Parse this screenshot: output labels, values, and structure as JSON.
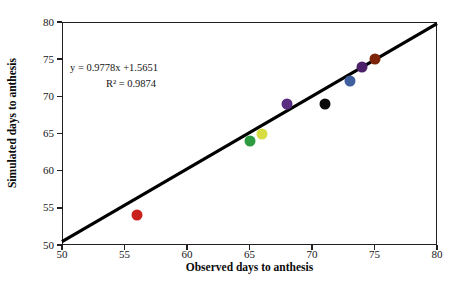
{
  "chart_data": {
    "type": "scatter",
    "title": "",
    "xlabel": "Observed days to anthesis",
    "ylabel": "Simulated days to anthesis",
    "xlim": [
      50,
      80
    ],
    "ylim": [
      50,
      80
    ],
    "xticks": [
      50,
      55,
      60,
      65,
      70,
      75,
      80
    ],
    "yticks": [
      50,
      55,
      60,
      65,
      70,
      75,
      80
    ],
    "grid": false,
    "legend": "none",
    "annotations": {
      "equation": "y = 0.9778x +1.5651",
      "r_squared": "R² = 0.9874",
      "slope": 0.9778,
      "intercept": 1.5651,
      "r2_value": 0.9874
    },
    "trendline": {
      "type": "linear",
      "slope": 0.9778,
      "intercept": 1.5651,
      "x_start": 50,
      "y_start": 50.455,
      "x_end": 80,
      "y_end": 79.789,
      "color": "#000000",
      "width": 3.2
    },
    "points": [
      {
        "x": 56,
        "y": 54,
        "color": "#c9211e"
      },
      {
        "x": 65,
        "y": 64,
        "color": "#2e9b40"
      },
      {
        "x": 66,
        "y": 65,
        "color": "#d6de42"
      },
      {
        "x": 68,
        "y": 69,
        "color": "#5b2d82"
      },
      {
        "x": 71,
        "y": 69,
        "color": "#0a0a0a"
      },
      {
        "x": 73,
        "y": 72,
        "color": "#3f5f9e"
      },
      {
        "x": 74,
        "y": 74,
        "color": "#4b2269"
      },
      {
        "x": 75,
        "y": 75,
        "color": "#7d2408"
      }
    ]
  },
  "axes": {
    "x_tick_labels": [
      "50",
      "55",
      "60",
      "65",
      "70",
      "75",
      "80"
    ],
    "y_tick_labels": [
      "50",
      "55",
      "60",
      "65",
      "70",
      "75",
      "80"
    ],
    "x_title": "Observed days to anthesis",
    "y_title": "Simulated days to anthesis"
  },
  "annotation": {
    "equation": "y = 0.9778x +1.5651",
    "r_squared": "R² = 0.9874"
  },
  "colors": {
    "frame": "#231f20",
    "trendline": "#000000",
    "background": "#ffffff",
    "text": "#151515"
  }
}
